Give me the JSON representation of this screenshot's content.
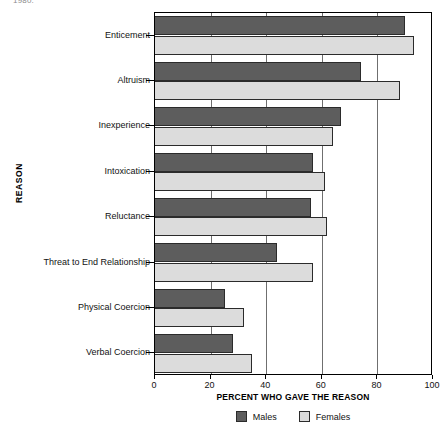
{
  "top_fragment": "1980.",
  "legend": {
    "position": "bottom-center",
    "entries": [
      {
        "label": "Males",
        "color": "#5d5d5d"
      },
      {
        "label": "Females",
        "color": "#dcdcdc"
      }
    ]
  },
  "chart_data": {
    "type": "bar",
    "orientation": "horizontal",
    "title": "",
    "xlabel": "PERCENT WHO GAVE THE REASON",
    "ylabel": "REASON",
    "xlim": [
      0,
      100
    ],
    "xticks": [
      0,
      20,
      40,
      60,
      80,
      100
    ],
    "xtick_labels": [
      "0",
      "20",
      "40",
      "60",
      "80",
      "100"
    ],
    "grid": "vertical",
    "legend_position": "bottom-center",
    "categories": [
      "Enticement",
      "Altruism",
      "Inexperience",
      "Intoxication",
      "Reluctance",
      "Threat to End Relationship",
      "Physical Coercion",
      "Verbal Coercion"
    ],
    "series": [
      {
        "name": "Males",
        "color": "#5d5d5d",
        "values": [
          90,
          74,
          67,
          57,
          56,
          44,
          25,
          28
        ]
      },
      {
        "name": "Females",
        "color": "#dcdcdc",
        "values": [
          93,
          88,
          64,
          61,
          62,
          57,
          32,
          35
        ]
      }
    ]
  }
}
